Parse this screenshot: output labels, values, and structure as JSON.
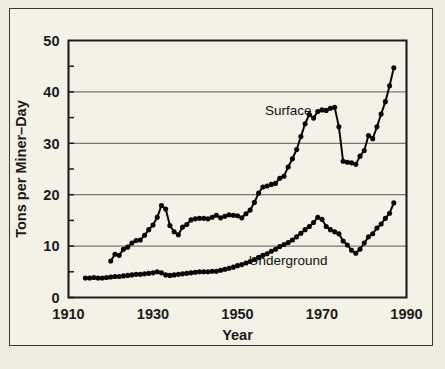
{
  "figure": {
    "background_color": "#efece1",
    "panel_color": "#f4f1e6",
    "frame_color": "#3a372f",
    "ink_color": "#080808"
  },
  "chart_data": {
    "type": "line",
    "title": "",
    "xlabel": "Year",
    "ylabel": "Tons per Miner–Day",
    "xlim": [
      1910,
      1990
    ],
    "ylim": [
      0,
      50
    ],
    "xticks": [
      1910,
      1930,
      1950,
      1970,
      1990
    ],
    "xticklabels": [
      "1910",
      "1930",
      "1950",
      "1970",
      "1990"
    ],
    "yticks": [
      0,
      10,
      20,
      30,
      40,
      50
    ],
    "yticklabels": [
      "0",
      "10",
      "20",
      "30",
      "40",
      "50"
    ],
    "yminorticks": [
      5,
      15,
      25,
      35,
      45
    ],
    "grid": "horizontal-major",
    "legend_position": "inline-annotations",
    "marker": "filled-circle",
    "series": [
      {
        "name": "Surface",
        "label_x": 1962,
        "label_y": 35.5,
        "x": [
          1920,
          1921,
          1922,
          1923,
          1924,
          1925,
          1926,
          1927,
          1928,
          1929,
          1930,
          1931,
          1932,
          1933,
          1934,
          1935,
          1936,
          1937,
          1938,
          1939,
          1940,
          1941,
          1942,
          1943,
          1944,
          1945,
          1946,
          1947,
          1948,
          1949,
          1950,
          1951,
          1952,
          1953,
          1954,
          1955,
          1956,
          1957,
          1958,
          1959,
          1960,
          1961,
          1962,
          1963,
          1964,
          1965,
          1966,
          1967,
          1968,
          1969,
          1970,
          1971,
          1972,
          1973,
          1974,
          1975,
          1976,
          1977,
          1978,
          1979,
          1980,
          1981,
          1982,
          1983,
          1984,
          1985,
          1986,
          1987
        ],
        "y": [
          7.1,
          8.4,
          8.2,
          9.4,
          9.8,
          10.6,
          11.1,
          11.2,
          12.1,
          13.2,
          14.1,
          15.6,
          17.9,
          17.2,
          14.0,
          12.8,
          12.2,
          13.7,
          14.2,
          15.1,
          15.3,
          15.4,
          15.4,
          15.3,
          15.6,
          16.0,
          15.5,
          15.8,
          16.1,
          16.0,
          15.9,
          15.5,
          16.3,
          17.0,
          18.5,
          20.3,
          21.5,
          21.7,
          22.0,
          22.2,
          23.2,
          23.6,
          25.4,
          27.0,
          28.8,
          31.3,
          33.8,
          35.6,
          34.9,
          36.2,
          36.5,
          36.4,
          36.8,
          37.0,
          33.2,
          26.5,
          26.3,
          26.2,
          25.9,
          27.5,
          28.6,
          31.5,
          30.9,
          33.2,
          35.7,
          38.1,
          41.2,
          44.7
        ]
      },
      {
        "name": "Underground",
        "label_x": 1962,
        "label_y": 6.4,
        "x": [
          1914,
          1915,
          1916,
          1917,
          1918,
          1919,
          1920,
          1921,
          1922,
          1923,
          1924,
          1925,
          1926,
          1927,
          1928,
          1929,
          1930,
          1931,
          1932,
          1933,
          1934,
          1935,
          1936,
          1937,
          1938,
          1939,
          1940,
          1941,
          1942,
          1943,
          1944,
          1945,
          1946,
          1947,
          1948,
          1949,
          1950,
          1951,
          1952,
          1953,
          1954,
          1955,
          1956,
          1957,
          1958,
          1959,
          1960,
          1961,
          1962,
          1963,
          1964,
          1965,
          1966,
          1967,
          1968,
          1969,
          1970,
          1971,
          1972,
          1973,
          1974,
          1975,
          1976,
          1977,
          1978,
          1979,
          1980,
          1981,
          1982,
          1983,
          1984,
          1985,
          1986,
          1987
        ],
        "y": [
          3.8,
          3.8,
          3.9,
          3.8,
          3.8,
          3.9,
          4.0,
          4.1,
          4.1,
          4.2,
          4.3,
          4.4,
          4.5,
          4.5,
          4.6,
          4.7,
          4.8,
          5.0,
          4.8,
          4.4,
          4.3,
          4.4,
          4.5,
          4.6,
          4.7,
          4.8,
          4.9,
          5.0,
          5.0,
          5.0,
          5.1,
          5.1,
          5.3,
          5.5,
          5.7,
          5.9,
          6.2,
          6.4,
          6.7,
          7.0,
          7.4,
          7.8,
          8.2,
          8.5,
          9.0,
          9.4,
          9.9,
          10.3,
          10.7,
          11.2,
          11.8,
          12.5,
          13.2,
          13.8,
          14.6,
          15.6,
          15.2,
          13.8,
          13.2,
          12.8,
          12.4,
          11.0,
          10.2,
          9.2,
          8.6,
          9.4,
          10.6,
          11.8,
          12.4,
          13.5,
          14.3,
          15.4,
          16.4,
          18.4
        ]
      }
    ]
  }
}
